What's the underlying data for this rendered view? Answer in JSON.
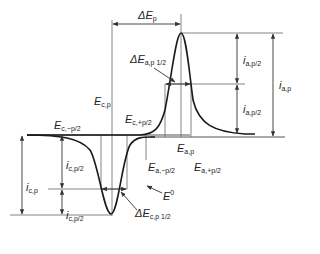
{
  "diagram": {
    "type": "cyclic voltammogram annotation",
    "colors": {
      "curve": "#1a1a1a",
      "lines": "#555555",
      "text": "#222222"
    },
    "labels": {
      "delta_ep": {
        "main": "ΔE",
        "sub": "p"
      },
      "delta_ea_half": {
        "main": "ΔE",
        "sub": "a,p 1/2"
      },
      "delta_ec_half": {
        "main": "ΔE",
        "sub": "c,p 1/2"
      },
      "e_cp": {
        "main": "E",
        "sub": "c,p"
      },
      "e_c_plus": {
        "main": "E",
        "sub": "c,+p/2"
      },
      "e_c_minus": {
        "main": "E",
        "sub": "c,−p/2"
      },
      "e_ap": {
        "main": "E",
        "sub": "a,p"
      },
      "e_a_minus": {
        "main": "E",
        "sub": "a,−p/2"
      },
      "e_a_plus": {
        "main": "E",
        "sub": "a,+p/2"
      },
      "e0": {
        "main": "E",
        "sup": "0"
      },
      "i_ap_half_top": {
        "main": "i",
        "sub": "a,p/2"
      },
      "i_ap_half_bottom": {
        "main": "i",
        "sub": "a,p/2"
      },
      "i_ap": {
        "main": "i",
        "sub": "a,p"
      },
      "i_cp": {
        "main": "i",
        "sub": "c,p"
      },
      "i_cp_half_top": {
        "main": "i",
        "sub": "c,p/2"
      },
      "i_cp_half_bottom": {
        "main": "i",
        "sub": "c,p/2"
      }
    }
  }
}
